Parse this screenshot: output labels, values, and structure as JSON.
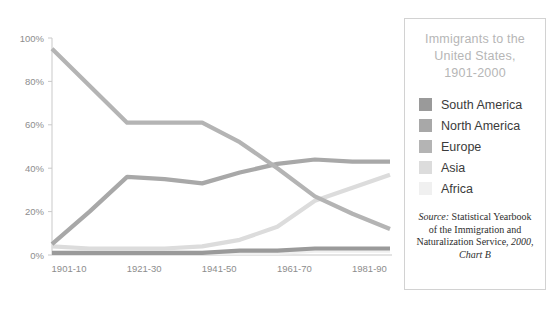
{
  "chart_data": {
    "type": "line",
    "title": "Immigrants to the United States, 1901-2000",
    "xlabel": "",
    "ylabel": "",
    "ylim": [
      0,
      100
    ],
    "ytick_labels": [
      "0%",
      "20%",
      "40%",
      "60%",
      "80%",
      "100%"
    ],
    "ytick_values": [
      0,
      20,
      40,
      60,
      80,
      100
    ],
    "grid": false,
    "legend_position": "right",
    "x": [
      "1901-10",
      "1911-20",
      "1921-30",
      "1931-40",
      "1941-50",
      "1951-60",
      "1961-70",
      "1971-80",
      "1981-90",
      "1991-2000"
    ],
    "xtick_labels": [
      "1901-10",
      "1921-30",
      "1941-50",
      "1961-70",
      "1981-90"
    ],
    "xtick_indices": [
      0,
      2,
      4,
      6,
      8
    ],
    "series": [
      {
        "name": "South America",
        "color": "#9a9a9a",
        "values": [
          1,
          1,
          1,
          1,
          1,
          2,
          2,
          3,
          3,
          3
        ]
      },
      {
        "name": "North America",
        "color": "#a8a8a8",
        "values": [
          5,
          20,
          36,
          35,
          33,
          38,
          42,
          44,
          43,
          43
        ]
      },
      {
        "name": "Europe",
        "color": "#b4b4b4",
        "values": [
          95,
          78,
          61,
          61,
          61,
          52,
          40,
          27,
          19,
          12
        ]
      },
      {
        "name": "Asia",
        "color": "#dcdcdc",
        "values": [
          4,
          3,
          3,
          3,
          4,
          7,
          13,
          25,
          31,
          37
        ]
      },
      {
        "name": "Africa",
        "color": "#f0f0f0",
        "values": [
          1,
          1,
          1,
          1,
          1,
          1,
          1,
          2,
          2,
          2
        ]
      }
    ]
  },
  "legend": {
    "title_lines": [
      "Immigrants to the",
      "United States,",
      "1901-2000"
    ],
    "entries": [
      {
        "label": "South America",
        "color": "#9a9a9a"
      },
      {
        "label": "North America",
        "color": "#a8a8a8"
      },
      {
        "label": "Europe",
        "color": "#b4b4b4"
      },
      {
        "label": "Asia",
        "color": "#dcdcdc"
      },
      {
        "label": "Africa",
        "color": "#f0f0f0"
      }
    ],
    "source": {
      "prefix": "Source:",
      "body": " Statistical Yearbook of the Immigration and Naturalization Service,",
      "suffix": " 2000, Chart B"
    }
  },
  "style": {
    "axis_color": "#c9c9c9",
    "tick_text_color": "#8d8d8d",
    "line_width": 4.2
  }
}
